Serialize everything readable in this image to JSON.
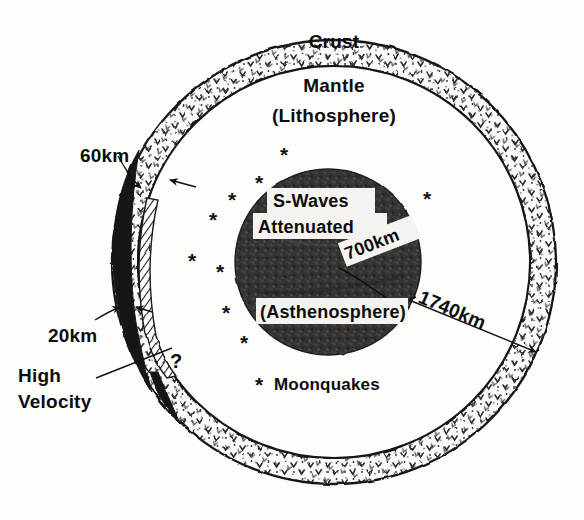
{
  "figure": {
    "name": "lunar-interior-cross-section"
  },
  "layers": {
    "crust_label": "Crust",
    "mantle_label": "Mantle",
    "lithosphere_label": "(Lithosphere)",
    "asthenosphere_label": "(Asthenosphere)"
  },
  "core_labels": {
    "s_waves": "S-Waves",
    "attenuated": "Attenuated"
  },
  "dimensions": {
    "crust_thick_far": "60km",
    "crust_thick_near": "20km",
    "asthenosphere_depth": "700km",
    "moon_radius": "1740km"
  },
  "annotations": {
    "high_velocity_line1": "High",
    "high_velocity_line2": "Velocity",
    "question_mark": "?",
    "legend_symbol": "*",
    "legend_label": "Moonquakes"
  },
  "colors": {
    "ink": "#141414",
    "paper": "#fdfdfc",
    "core_fill": "#3c3a38",
    "crust_fill": "#fbfbf9",
    "highvel_fill": "#141414",
    "label_box": "#f4f3ef"
  },
  "moonquakes": {
    "symbol": "*",
    "points": [
      {
        "x": 284,
        "y": 162
      },
      {
        "x": 259,
        "y": 190
      },
      {
        "x": 232,
        "y": 207
      },
      {
        "x": 213,
        "y": 227
      },
      {
        "x": 427,
        "y": 206
      },
      {
        "x": 192,
        "y": 268
      },
      {
        "x": 220,
        "y": 279
      },
      {
        "x": 226,
        "y": 320
      },
      {
        "x": 244,
        "y": 350
      }
    ]
  },
  "geometry": {
    "center_x": 334,
    "center_y": 262,
    "outer_radius": 222,
    "inner_radius": 196,
    "core_center_x": 328,
    "core_center_y": 262,
    "core_radius": 93
  }
}
